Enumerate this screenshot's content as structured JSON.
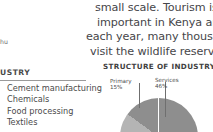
{
  "body_text": {
    "lines": [
      "small scale. Tourism is increa",
      "important in Kenya and Tanza",
      "each year, many thousands of",
      "visit the wildlife reserves there."
    ]
  },
  "margin_fragment": {
    "text": "hu"
  },
  "industry_list": {
    "heading": "USTRY",
    "items": [
      "Cement manufacturing",
      "Chemicals",
      "Food processing",
      "Textiles"
    ]
  },
  "chart_data": {
    "type": "pie",
    "title": "STRUCTURE OF INDUSTRY",
    "categories": [
      "Services",
      "Primary",
      "Secondary"
    ],
    "values": [
      46,
      15,
      39
    ],
    "labels": [
      {
        "name": "Primary",
        "percent": "15%"
      },
      {
        "name": "Services",
        "percent": "46%"
      }
    ],
    "colors": [
      "#8e8e8e",
      "#d7d7d7",
      "#b4b4b4"
    ],
    "legend": "none",
    "grid": false
  }
}
